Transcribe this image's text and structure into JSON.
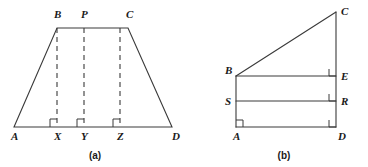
{
  "figure": {
    "background_color": "#ffffff",
    "line_color": "#3a3a3a",
    "text_color": "#1a1a1a",
    "width": 368,
    "height": 167
  },
  "diagram_a": {
    "caption": "(a)",
    "shape": "trapezoid",
    "caption_position": {
      "x": 95,
      "y": 159
    },
    "vertices": [
      {
        "name": "A",
        "label": "A",
        "x": 14,
        "y": 127,
        "label_x": 11,
        "label_y": 140
      },
      {
        "name": "B",
        "label": "B",
        "x": 57,
        "y": 28,
        "label_x": 54,
        "label_y": 18
      },
      {
        "name": "C",
        "label": "C",
        "x": 128,
        "y": 28,
        "label_x": 126,
        "label_y": 18
      },
      {
        "name": "D",
        "label": "D",
        "x": 172,
        "y": 127,
        "label_x": 172,
        "label_y": 140
      },
      {
        "name": "P",
        "label": "P",
        "x": 84,
        "y": 28,
        "label_x": 81,
        "label_y": 18
      },
      {
        "name": "X",
        "label": "X",
        "x": 57,
        "y": 127,
        "label_x": 54,
        "label_y": 140
      },
      {
        "name": "Y",
        "label": "Y",
        "x": 84,
        "y": 127,
        "label_x": 81,
        "label_y": 140
      },
      {
        "name": "Z",
        "label": "Z",
        "x": 120,
        "y": 127,
        "label_x": 117,
        "label_y": 140
      }
    ],
    "outline": "M 14 127 L 57 28 L 128 28 L 172 127 Z",
    "dashed_segments": [
      {
        "name": "segment-B-X",
        "x1": 57,
        "y1": 28,
        "x2": 57,
        "y2": 127
      },
      {
        "name": "segment-P-Y",
        "x1": 84,
        "y1": 28,
        "x2": 84,
        "y2": 127
      },
      {
        "name": "segment-C-Z",
        "x1": 120,
        "y1": 28,
        "x2": 120,
        "y2": 127
      }
    ],
    "right_angles": [
      {
        "name": "right-angle-at-X",
        "path": "M 50 127 L 50 119 L 57 119"
      },
      {
        "name": "right-angle-at-Y",
        "path": "M 77 127 L 77 119 L 84 119"
      },
      {
        "name": "right-angle-at-Z",
        "path": "M 113 127 L 113 119 L 120 119"
      }
    ]
  },
  "diagram_b": {
    "caption": "(b)",
    "shape": "right-trapezoid-with-transversals",
    "caption_position": {
      "x": 284,
      "y": 159
    },
    "vertices": [
      {
        "name": "A",
        "label": "A",
        "x": 236,
        "y": 127,
        "label_x": 233,
        "label_y": 140
      },
      {
        "name": "B",
        "label": "B",
        "x": 236,
        "y": 76,
        "label_x": 225,
        "label_y": 74
      },
      {
        "name": "C",
        "label": "C",
        "x": 336,
        "y": 12,
        "label_x": 341,
        "label_y": 15
      },
      {
        "name": "D",
        "label": "D",
        "x": 336,
        "y": 127,
        "label_x": 338,
        "label_y": 140
      },
      {
        "name": "E",
        "label": "E",
        "x": 336,
        "y": 76,
        "label_x": 341,
        "label_y": 80
      },
      {
        "name": "R",
        "label": "R",
        "x": 336,
        "y": 101,
        "label_x": 341,
        "label_y": 105
      },
      {
        "name": "S",
        "label": "S",
        "x": 236,
        "y": 101,
        "label_x": 225,
        "label_y": 105
      }
    ],
    "solid_segments": [
      {
        "name": "segment-B-C",
        "x1": 236,
        "y1": 76,
        "x2": 336,
        "y2": 12
      },
      {
        "name": "segment-C-D",
        "x1": 336,
        "y1": 12,
        "x2": 336,
        "y2": 127
      },
      {
        "name": "segment-B-A",
        "x1": 236,
        "y1": 76,
        "x2": 236,
        "y2": 127
      },
      {
        "name": "segment-B-E",
        "x1": 236,
        "y1": 76,
        "x2": 336,
        "y2": 76
      },
      {
        "name": "segment-S-R",
        "x1": 236,
        "y1": 101,
        "x2": 336,
        "y2": 101
      },
      {
        "name": "segment-A-D",
        "x1": 236,
        "y1": 127,
        "x2": 336,
        "y2": 127
      }
    ],
    "right_angles": [
      {
        "name": "right-angle-at-E",
        "path": "M 329 69 L 329 76 L 336 76"
      },
      {
        "name": "right-angle-at-R",
        "path": "M 329 94 L 329 101 L 336 101"
      },
      {
        "name": "right-angle-at-A",
        "path": "M 236 120 L 243 120 L 243 127"
      },
      {
        "name": "right-angle-at-D",
        "path": "M 329 120 L 329 127 L 336 127"
      }
    ]
  }
}
